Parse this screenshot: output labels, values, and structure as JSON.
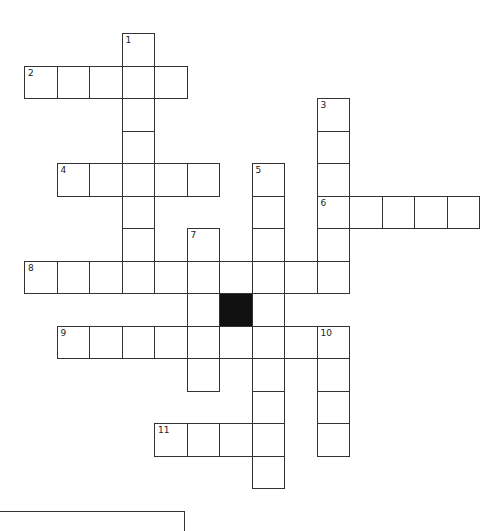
{
  "puzzle": {
    "origin_x": 24,
    "origin_y": 33,
    "cell_size": 32.5,
    "colors": {
      "border": "#333333",
      "block": "#111111",
      "cell": "#ffffff"
    },
    "entries": [
      {
        "number": "1",
        "direction": "down",
        "row": 0,
        "col": 3,
        "length": 8
      },
      {
        "number": "2",
        "direction": "across",
        "row": 1,
        "col": 0,
        "length": 5
      },
      {
        "number": "3",
        "direction": "down",
        "row": 2,
        "col": 9,
        "length": 6
      },
      {
        "number": "4",
        "direction": "across",
        "row": 4,
        "col": 1,
        "length": 5
      },
      {
        "number": "5",
        "direction": "down",
        "row": 4,
        "col": 7,
        "length": 10
      },
      {
        "number": "6",
        "direction": "across",
        "row": 5,
        "col": 9,
        "length": 5
      },
      {
        "number": "7",
        "direction": "down",
        "row": 6,
        "col": 5,
        "length": 5
      },
      {
        "number": "8",
        "direction": "across",
        "row": 7,
        "col": 0,
        "length": 10
      },
      {
        "number": "9",
        "direction": "across",
        "row": 9,
        "col": 1,
        "length": 9
      },
      {
        "number": "10",
        "direction": "down",
        "row": 9,
        "col": 9,
        "length": 4
      },
      {
        "number": "11",
        "direction": "across",
        "row": 12,
        "col": 4,
        "length": 4
      }
    ],
    "black_cells": [
      {
        "row": 8,
        "col": 6
      }
    ]
  }
}
